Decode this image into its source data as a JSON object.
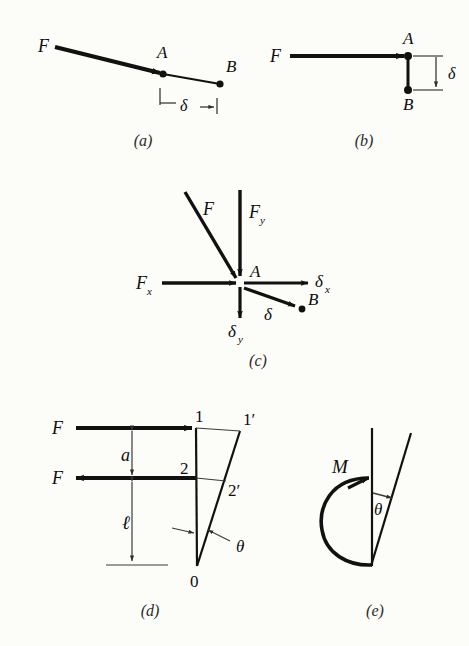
{
  "figure": {
    "background_color": "#fcfcf8",
    "ink_color": "#111111",
    "width": 469,
    "height": 646
  },
  "panels": [
    {
      "id": "a",
      "caption": "(a)",
      "description": "Axial force F applied along a slightly inclined member; point A displaces to B by delta.",
      "labels": {
        "force": "F",
        "point_a": "A",
        "point_b": "B",
        "deflection": "δ"
      }
    },
    {
      "id": "b",
      "caption": "(b)",
      "description": "Horizontal force F at point A with transverse deflection delta down to point B.",
      "labels": {
        "force": "F",
        "point_a": "A",
        "point_b": "B",
        "deflection": "δ"
      }
    },
    {
      "id": "c",
      "caption": "(c)",
      "description": "General force F at point A resolved into components Fx and Fy, with deflection delta resolved into delta-x and delta-y, ending at point B.",
      "labels": {
        "force": "F",
        "force_x": "F",
        "force_x_sub": "x",
        "force_y": "F",
        "force_y_sub": "y",
        "point_a": "A",
        "point_b": "B",
        "deflection": "δ",
        "deflection_x": "δ",
        "deflection_x_sub": "x",
        "deflection_y": "δ",
        "deflection_y_sub": "y"
      }
    },
    {
      "id": "d",
      "caption": "(d)",
      "description": "Couple formed by two equal opposite forces F separated by distance a, acting on a cantilever of length l rotating through angle theta about point 0.",
      "labels": {
        "force_top": "F",
        "force_bottom": "F",
        "dim_a": "a",
        "dim_l": "ℓ",
        "node_1": "1",
        "node_1p": "1′",
        "node_2": "2",
        "node_2p": "2′",
        "node_0": "0",
        "angle": "θ"
      }
    },
    {
      "id": "e",
      "caption": "(e)",
      "description": "Applied moment M producing an angular rotation theta of the member.",
      "labels": {
        "moment": "M",
        "angle": "θ"
      }
    }
  ]
}
